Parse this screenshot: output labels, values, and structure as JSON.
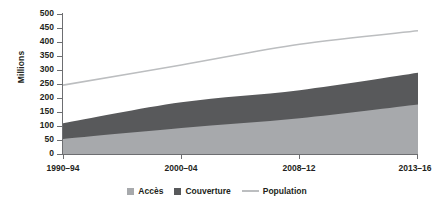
{
  "chart_data": {
    "type": "area",
    "title": "",
    "xlabel": "",
    "ylabel": "Millions",
    "ylim": [
      0,
      500
    ],
    "ytick_step": 50,
    "yticks": [
      0,
      50,
      100,
      150,
      200,
      250,
      300,
      350,
      400,
      450,
      500
    ],
    "ytick_labels": [
      "0",
      "50",
      "100",
      "150",
      "200",
      "250",
      "300",
      "350",
      "400",
      "450",
      "500"
    ],
    "categories": [
      "1990–94",
      "2000–04",
      "2008–12",
      "2013–16"
    ],
    "x": [
      0,
      1,
      2,
      3
    ],
    "grid": false,
    "legend_position": "bottom",
    "stacked": true,
    "series": [
      {
        "name": "Accès",
        "type": "area",
        "color": "#a7a9ac",
        "values": [
          54,
          93,
          128,
          177
        ]
      },
      {
        "name": "Couverture",
        "type": "area",
        "color": "#58595b",
        "values": [
          56,
          92,
          100,
          113
        ]
      },
      {
        "name": "Population",
        "type": "line",
        "color": "#bcbec0",
        "values": [
          246,
          318,
          392,
          440
        ]
      }
    ],
    "series_cumulative_tops": {
      "Accès": [
        54,
        93,
        128,
        177
      ],
      "Couverture": [
        110,
        185,
        228,
        290
      ]
    }
  },
  "axis": {
    "y_title": "Millions"
  },
  "legend": {
    "items": [
      {
        "label": "Accès",
        "icon": "square-swatch",
        "color": "#a7a9ac"
      },
      {
        "label": "Couverture",
        "icon": "square-swatch",
        "color": "#58595b"
      },
      {
        "label": "Population",
        "icon": "line-swatch",
        "color": "#bcbec0"
      }
    ]
  }
}
